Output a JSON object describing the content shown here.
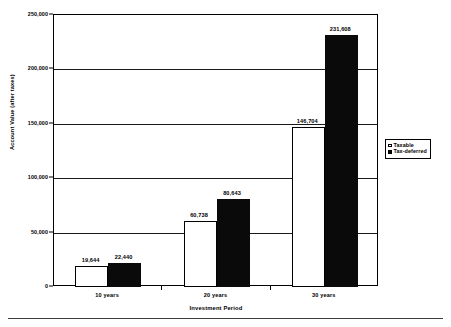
{
  "chart_data": {
    "type": "bar",
    "title": "",
    "xlabel": "Investment Period",
    "ylabel": "Account Value (after taxes)",
    "categories": [
      "10 years",
      "20 years",
      "30 years"
    ],
    "series": [
      {
        "name": "Taxable",
        "color": "#ffffff",
        "values": [
          19644,
          60738,
          146704
        ],
        "labels": [
          "19,644",
          "60,738",
          "146,704"
        ]
      },
      {
        "name": "Tax-deferred",
        "color": "#0a0a0a",
        "values": [
          22440,
          80643,
          231608
        ],
        "labels": [
          "22,440",
          "80,643",
          "231,608"
        ]
      }
    ],
    "ylim": [
      0,
      250000
    ],
    "yticks": [
      0,
      50000,
      100000,
      150000,
      200000,
      250000
    ],
    "ytick_labels": [
      "0",
      "50,000",
      "100,000",
      "150,000",
      "200,000",
      "250,000"
    ],
    "grid": true,
    "legend_position": "right"
  },
  "legend": {
    "items": [
      {
        "label": "Taxable",
        "swatch": "white-square-icon"
      },
      {
        "label": "Tax-deferred",
        "swatch": "black-square-icon"
      }
    ]
  }
}
